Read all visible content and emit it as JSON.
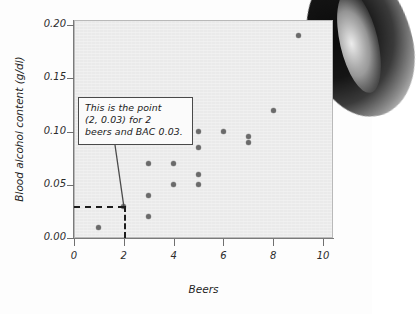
{
  "figure": {
    "annotation": {
      "line1": "This is the point",
      "line2": "(2, 0.03) for 2",
      "line3": "beers and BAC 0.03."
    }
  },
  "chart_data": {
    "type": "scatter",
    "title": "",
    "xlabel": "Beers",
    "ylabel": "Blood alcohol content (g/dl)",
    "xlim": [
      0,
      10.4
    ],
    "ylim": [
      0.0,
      0.205
    ],
    "xticks": [
      "0",
      "2",
      "4",
      "6",
      "8",
      "10"
    ],
    "xtick_values": [
      0,
      2,
      4,
      6,
      8,
      10
    ],
    "yticks": [
      "0.00",
      "0.05",
      "0.10",
      "0.15",
      "0.20"
    ],
    "ytick_values": [
      0.0,
      0.05,
      0.1,
      0.15,
      0.2
    ],
    "grid": false,
    "legend": null,
    "point_color": "#6a6a6a",
    "plot_background": "#eaeaea",
    "x": [
      1,
      2,
      3,
      3,
      3,
      4,
      4,
      5,
      5,
      5,
      5,
      6,
      7,
      7,
      8,
      9
    ],
    "y": [
      0.01,
      0.03,
      0.02,
      0.04,
      0.07,
      0.05,
      0.07,
      0.05,
      0.06,
      0.085,
      0.1,
      0.1,
      0.09,
      0.095,
      0.12,
      0.19
    ],
    "points": [
      {
        "x": 1,
        "y": 0.01
      },
      {
        "x": 2,
        "y": 0.03
      },
      {
        "x": 3,
        "y": 0.02
      },
      {
        "x": 3,
        "y": 0.04
      },
      {
        "x": 3,
        "y": 0.07
      },
      {
        "x": 4,
        "y": 0.05
      },
      {
        "x": 4,
        "y": 0.07
      },
      {
        "x": 5,
        "y": 0.05
      },
      {
        "x": 5,
        "y": 0.06
      },
      {
        "x": 5,
        "y": 0.085
      },
      {
        "x": 5,
        "y": 0.1
      },
      {
        "x": 6,
        "y": 0.1
      },
      {
        "x": 7,
        "y": 0.09
      },
      {
        "x": 7,
        "y": 0.095
      },
      {
        "x": 8,
        "y": 0.12
      },
      {
        "x": 9,
        "y": 0.19
      }
    ],
    "annotations": [
      {
        "text": "This is the point (2, 0.03) for 2 beers and BAC 0.03.",
        "target_point": {
          "x": 2,
          "y": 0.03
        },
        "guide_lines": "dashed lines from axes to (2, 0.03)"
      }
    ]
  }
}
